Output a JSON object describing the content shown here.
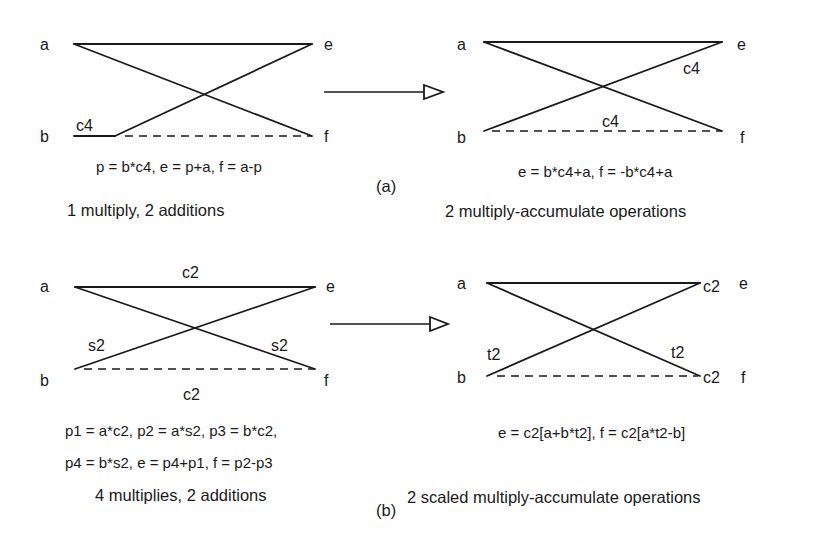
{
  "figure": {
    "part_a": {
      "label": "(a)",
      "left": {
        "nodes": {
          "a": "a",
          "b": "b",
          "e": "e",
          "f": "f"
        },
        "edge_labels": {
          "b_coef": "c4"
        },
        "equation": "p = b*c4, e = p+a, f = a-p",
        "cost": "1 multiply, 2 additions"
      },
      "right": {
        "nodes": {
          "a": "a",
          "b": "b",
          "e": "e",
          "f": "f"
        },
        "edge_labels": {
          "diag": "c4",
          "bottom": "c4"
        },
        "equation": "e = b*c4+a, f = -b*c4+a",
        "cost": "2 multiply-accumulate operations"
      }
    },
    "part_b": {
      "label": "(b)",
      "left": {
        "nodes": {
          "a": "a",
          "b": "b",
          "e": "e",
          "f": "f"
        },
        "edge_labels": {
          "top": "c2",
          "left_diag": "s2",
          "right_diag": "s2",
          "bottom": "c2"
        },
        "equation_line1": "p1 = a*c2, p2 = a*s2, p3 = b*c2,",
        "equation_line2": "p4  =  b*s2, e = p4+p1, f = p2-p3",
        "cost": "4 multiplies, 2 additions"
      },
      "right": {
        "nodes": {
          "a": "a",
          "b": "b",
          "e": "e",
          "f": "f"
        },
        "edge_labels": {
          "top_scale": "c2",
          "bottom_scale": "c2",
          "left_diag": "t2",
          "right_diag": "t2"
        },
        "equation": "e =  c2[a+b*t2], f = c2[a*t2-b]",
        "cost": "2 scaled multiply-accumulate operations"
      }
    },
    "transform_arrow": "hollow-triangle-arrow"
  }
}
